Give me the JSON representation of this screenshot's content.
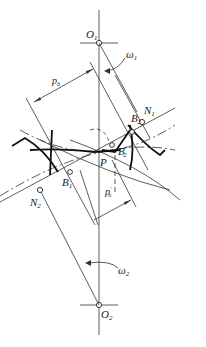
{
  "diagram": {
    "type": "gear-meshing",
    "points": {
      "O1": {
        "label": "O",
        "sub": "1"
      },
      "O2": {
        "label": "O",
        "sub": "2"
      },
      "N1": {
        "label": "N",
        "sub": "1"
      },
      "N2": {
        "label": "N",
        "sub": "2"
      },
      "P": {
        "label": "P"
      },
      "B1": {
        "label": "B",
        "sub": "1"
      },
      "B2": {
        "label": "B",
        "sub": "2"
      },
      "B2p": {
        "label": "B",
        "sub": "2",
        "prime": "'"
      }
    },
    "dimensions": {
      "pb": {
        "label": "p",
        "sub": "b"
      },
      "pb_prime": {
        "label": "p",
        "sub": "b",
        "prime": "'"
      }
    },
    "angular_velocities": {
      "w1": {
        "label": "ω",
        "sub": "1"
      },
      "w2": {
        "label": "ω",
        "sub": "2"
      }
    },
    "colors": {
      "line": "#2a2a2a",
      "background": "#ffffff"
    }
  }
}
